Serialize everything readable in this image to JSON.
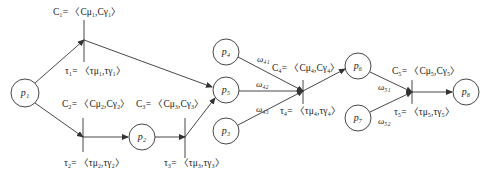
{
  "places": [
    {
      "id": "p1",
      "label": "p₁",
      "cx": 25,
      "cy": 93
    },
    {
      "id": "p2",
      "label": "p₂",
      "cx": 142,
      "cy": 137
    },
    {
      "id": "p3",
      "label": "p₃",
      "cx": 226,
      "cy": 131
    },
    {
      "id": "p4",
      "label": "p₄",
      "cx": 226,
      "cy": 52
    },
    {
      "id": "p5",
      "label": "p₅",
      "cx": 226,
      "cy": 90
    },
    {
      "id": "p6",
      "label": "p₆",
      "cx": 358,
      "cy": 66
    },
    {
      "id": "p7",
      "label": "p₇",
      "cx": 358,
      "cy": 118
    },
    {
      "id": "p8",
      "label": "p₈",
      "cx": 466,
      "cy": 92
    }
  ],
  "transitions": [
    {
      "id": "t1",
      "c_label": "C₁= 〈Cμ₁,Cγ₁〉",
      "tau_label": "τ₁= 〈τμ₁,τγ₁〉"
    },
    {
      "id": "t2",
      "c_label": "C₂= 〈Cμ₂,Cγ₂〉",
      "tau_label": "τ₂= 〈τμ₂,τγ₂〉"
    },
    {
      "id": "t3",
      "c_label": "C₃= 〈Cμ₃,Cγ₃〉",
      "tau_label": "τ₃= 〈τμ₃,τγ₃〉"
    },
    {
      "id": "t4",
      "c_label": "C₄= 〈Cμ₄,Cγ₄〉",
      "tau_label": "τ₄= 〈τμ₄,τγ₄〉"
    },
    {
      "id": "t5",
      "c_label": "C₅= 〈Cμ₅,Cγ₅〉",
      "tau_label": "τ₅= 〈τμ₅,τγ₅〉"
    }
  ],
  "weights": {
    "w41": "ω₄₁",
    "w42": "ω₄₂",
    "w43": "ω₄₃",
    "w51": "ω₅₁",
    "w52": "ω₅₂"
  },
  "colors": {
    "stroke": "#333333",
    "text": "#222222",
    "background": "#ffffff"
  }
}
